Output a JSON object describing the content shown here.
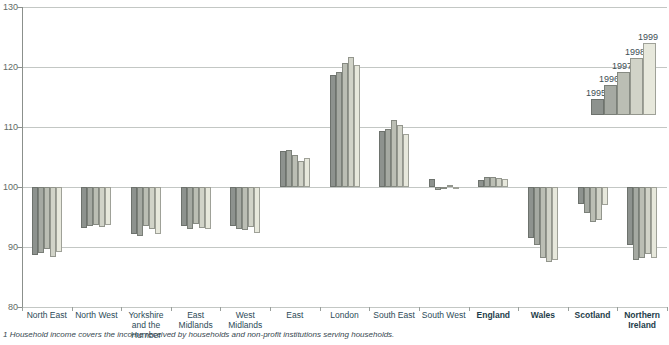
{
  "chart_data": {
    "type": "bar",
    "grid": true,
    "legend_position": "top-right",
    "baseline_value": 100,
    "y_axis": {
      "min": 80,
      "max": 130,
      "ticks": [
        130,
        120,
        110,
        100,
        90,
        80
      ]
    },
    "categories": [
      {
        "label": "North East",
        "bold": false
      },
      {
        "label": "North West",
        "bold": false
      },
      {
        "label": "Yorkshire and the Humber",
        "bold": false
      },
      {
        "label": "East Midlands",
        "bold": false
      },
      {
        "label": "West Midlands",
        "bold": false
      },
      {
        "label": "East",
        "bold": false
      },
      {
        "label": "London",
        "bold": false
      },
      {
        "label": "South East",
        "bold": false
      },
      {
        "label": "South West",
        "bold": false
      },
      {
        "label": "England",
        "bold": true
      },
      {
        "label": "Wales",
        "bold": true
      },
      {
        "label": "Scotland",
        "bold": true
      },
      {
        "label": "Northern Ireland",
        "bold": true
      }
    ],
    "series": [
      {
        "name": "1995",
        "color": "#8d928e",
        "values": [
          88.6,
          93.1,
          92.2,
          93.5,
          93.5,
          106.0,
          118.7,
          109.4,
          101.3,
          101.2,
          91.5,
          97.2,
          90.3
        ]
      },
      {
        "name": "1996",
        "color": "#a5a9a2",
        "values": [
          89.0,
          93.5,
          91.8,
          93.0,
          93.0,
          106.2,
          119.1,
          109.6,
          99.5,
          101.6,
          90.4,
          95.7,
          87.8
        ]
      },
      {
        "name": "1997",
        "color": "#bbbeb4",
        "values": [
          89.6,
          93.6,
          93.5,
          93.8,
          92.9,
          105.4,
          120.7,
          111.2,
          99.9,
          101.6,
          88.2,
          94.2,
          88.1
        ]
      },
      {
        "name": "1998",
        "color": "#d1d3c8",
        "values": [
          88.4,
          93.3,
          93.0,
          93.1,
          93.4,
          104.4,
          121.6,
          110.4,
          100.4,
          101.5,
          87.5,
          94.5,
          88.8
        ]
      },
      {
        "name": "1999",
        "color": "#e7e8dc",
        "values": [
          89.1,
          93.7,
          92.1,
          93.0,
          92.3,
          104.9,
          120.3,
          108.8,
          99.6,
          101.3,
          87.8,
          97.0,
          88.1
        ]
      }
    ],
    "legend_labels": [
      "1995",
      "1996",
      "1997",
      "1998",
      "1999"
    ]
  },
  "footnote": "1   Household income covers the income received by households and non-profit institutions serving households.",
  "colors": {
    "grid": "#c3c7c4",
    "axis": "#8b908c",
    "y_tick_label": "#5f6b67",
    "x_label": "#2c4a57"
  }
}
